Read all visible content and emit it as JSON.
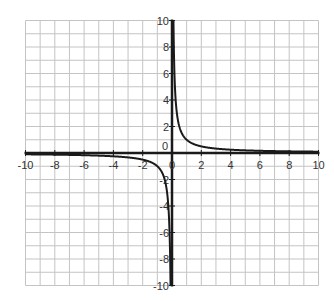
{
  "chart_data": {
    "type": "line",
    "title": "",
    "function": "y = 1/x",
    "xlabel": "",
    "ylabel": "",
    "xlim": [
      -10,
      10
    ],
    "ylim": [
      -10,
      10
    ],
    "grid": true,
    "grid_step": 1,
    "x_ticks": [
      -10,
      -8,
      -6,
      -4,
      -2,
      0,
      2,
      4,
      6,
      8,
      10
    ],
    "y_ticks": [
      -10,
      -8,
      -6,
      -4,
      -2,
      0,
      2,
      4,
      6,
      8,
      10
    ],
    "x_tick_labels": [
      "-10",
      "-8",
      "-6",
      "-4",
      "-2",
      "0",
      "2",
      "4",
      "6",
      "8",
      "10"
    ],
    "y_tick_labels": [
      "-10",
      "-8",
      "-6",
      "-4",
      "-2",
      "0",
      "2",
      "4",
      "6",
      "8",
      "10"
    ],
    "series": [
      {
        "name": "y = 1/x (x > 0)",
        "x": [
          0.1,
          0.125,
          0.2,
          0.25,
          0.5,
          1,
          2,
          4,
          6,
          8,
          10
        ],
        "values": [
          10,
          8,
          5,
          4,
          2,
          1,
          0.5,
          0.25,
          0.167,
          0.125,
          0.1
        ]
      },
      {
        "name": "y = 1/x (x < 0)",
        "x": [
          -10,
          -8,
          -6,
          -4,
          -2,
          -1,
          -0.5,
          -0.25,
          -0.2,
          -0.125,
          -0.1
        ],
        "values": [
          -0.1,
          -0.125,
          -0.167,
          -0.25,
          -0.5,
          -1,
          -2,
          -4,
          -5,
          -8,
          -10
        ]
      }
    ],
    "colors": {
      "curve": "#1a1a1a",
      "axes": "#1a1a1a",
      "grid": "#c4c4c4",
      "background": "#ffffff"
    }
  }
}
